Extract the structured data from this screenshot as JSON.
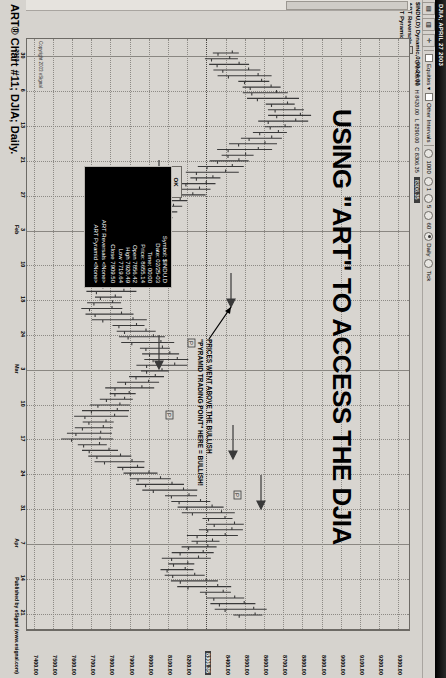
{
  "window": {
    "title": "DJIA; APRIL 27 2003"
  },
  "toolbar": {
    "buttons": [
      "grid-icon",
      "layout-icon",
      "plus-icon"
    ],
    "equities_label": "Equities",
    "other_intervals_label": "Other Intervals",
    "intervals": [
      {
        "label": "1000",
        "selected": false
      },
      {
        "label": "1",
        "selected": false
      },
      {
        "label": "5",
        "selected": false
      },
      {
        "label": "60",
        "selected": false
      },
      {
        "label": "Daily",
        "selected": true
      },
      {
        "label": "Tick",
        "selected": false
      }
    ]
  },
  "symbol_panel": {
    "symbol_line": "$INDU,D) Dynamic,0:00-24:00",
    "studies": [
      {
        "label": "ART Reversals",
        "icon": "study-square-icon"
      },
      {
        "label": "ART Pyramids (RB)",
        "icon": "study-square-icon"
      }
    ]
  },
  "quote_strip": {
    "open": "O 8400.00",
    "high": "H 8420.00",
    "low": "L 8290.00",
    "close": "C 8306.35",
    "last_highlighted": "8306.35"
  },
  "headline": "USING \"ART\" TO ACCESS THE DJIA",
  "annotation": {
    "line1": "PRICES WENT ABOVE THE BULLISH",
    "line2": "\"PYRAMID TRADING POINT\" HERE = BULLISH!"
  },
  "quote_dialog": {
    "ok_label": "OK",
    "rows": [
      "Symbol: $INDU.D",
      "Date: 02/25-03",
      "Time: 00:00",
      "Price: 8655.14",
      "Open 7856.42",
      "High 7920.49",
      "Low 7719.64",
      "Close 7909.50"
    ],
    "art_reversals": "ART Reversals <None>",
    "art_pyramid": "ART Pyramid <None>"
  },
  "copyright_note": "Copyright 2003 eSignal",
  "caption": "ART® Chart #11; DJIA; Daily.",
  "published_by": "Published by eSignal (www.esignal.com)",
  "colors": {
    "chart_bg": "#d8d5d0",
    "chrome": "#d6d3ce",
    "bar": "#3a3a3a",
    "grid": "#8d8a85",
    "dialog_bg": "#000000"
  },
  "chart_data": {
    "type": "line",
    "title": "USING \"ART\" TO ACCESS THE DJIA",
    "subtitle": "ART® Chart #11; DJIA; Daily.",
    "xlabel": "",
    "ylabel": "",
    "grid": true,
    "legend_position": "none",
    "ylim": [
      7400,
      9300
    ],
    "y_ticks": [
      "9300.00",
      "9200.00",
      "9100.00",
      "9000.00",
      "8900.00",
      "8800.00",
      "8700.00",
      "8600.00",
      "8500.00",
      "8400.00",
      "8306.35",
      "8200.00",
      "8100.00",
      "8000.00",
      "7900.00",
      "7800.00",
      "7700.00",
      "7600.00",
      "7500.00",
      "7400.00"
    ],
    "y_tick_selected": "8306.35",
    "x_ticks": [
      {
        "label": "30",
        "sub": "2003"
      },
      {
        "label": "6",
        "sub": ""
      },
      {
        "label": "13",
        "sub": ""
      },
      {
        "label": "21",
        "sub": ""
      },
      {
        "label": "27",
        "sub": ""
      },
      {
        "label": "3",
        "sub": "Feb"
      },
      {
        "label": "10",
        "sub": ""
      },
      {
        "label": "18",
        "sub": ""
      },
      {
        "label": "24",
        "sub": ""
      },
      {
        "label": "3",
        "sub": "Mar"
      },
      {
        "label": "10",
        "sub": ""
      },
      {
        "label": "17",
        "sub": ""
      },
      {
        "label": "24",
        "sub": ""
      },
      {
        "label": "31",
        "sub": ""
      },
      {
        "label": "7",
        "sub": "Apr"
      },
      {
        "label": "14",
        "sub": ""
      },
      {
        "label": "21",
        "sub": ""
      }
    ],
    "series": [
      {
        "name": "DJIA Daily OHLC bars",
        "values": [
          8400,
          8380,
          8420,
          8460,
          8500,
          8540,
          8580,
          8600,
          8640,
          8670,
          8700,
          8720,
          8690,
          8660,
          8620,
          8580,
          8540,
          8500,
          8460,
          8420,
          8380,
          8340,
          8300,
          8260,
          8220,
          8180,
          8140,
          8100,
          8060,
          8020,
          7980,
          7940,
          7900,
          7880,
          7860,
          7900,
          7940,
          7980,
          7950,
          7910,
          7880,
          7860,
          7840,
          7820,
          7800,
          7790,
          7830,
          7880,
          7920,
          7960,
          7990,
          8020,
          8050,
          8080,
          8110,
          8090,
          8050,
          8010,
          7970,
          7930,
          7890,
          7860,
          7830,
          7810,
          7790,
          7770,
          7750,
          7730,
          7720,
          7740,
          7780,
          7830,
          7880,
          7930,
          7980,
          8030,
          8080,
          8130,
          8180,
          8230,
          8280,
          8320,
          8360,
          8400,
          8380,
          8340,
          8300,
          8270,
          8240,
          8210,
          8180,
          8160,
          8200,
          8250,
          8300,
          8350,
          8400,
          8440,
          8480,
          8510
        ]
      }
    ],
    "annotations": [
      {
        "text": "PRICES WENT ABOVE THE BULLISH \"PYRAMID TRADING POINT\" HERE = BULLISH!",
        "points_to": "bullish breakout"
      }
    ],
    "quote_marker": {
      "symbol": "$INDU.D",
      "date": "02/25-03",
      "time": "00:00",
      "price": 8655.14,
      "open": 7856.42,
      "high": 7920.49,
      "low": 7719.64,
      "close": 7909.5
    }
  }
}
